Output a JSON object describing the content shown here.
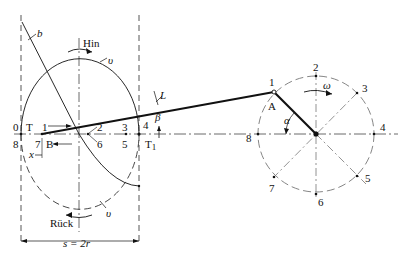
{
  "diagram": {
    "colors": {
      "line": "#111111",
      "dashed": "#555555",
      "bg": "#ffffff"
    },
    "labels": {
      "b": "b",
      "hin": "Hin",
      "v_top": "υ",
      "v_bottom": "υ",
      "rueck": "Rück",
      "L": "L",
      "A": "A",
      "alpha": "α",
      "beta": "β",
      "omega": "ω",
      "x": "x",
      "T": "T",
      "T1": "T",
      "T1_sub": "1",
      "B": "B",
      "stroke": "s = 2r"
    },
    "left_points": {
      "p0": "0",
      "p8": "8",
      "p1": "1",
      "p7": "7",
      "p2": "2",
      "p6": "6",
      "p3": "3",
      "p5": "5",
      "p4": "4"
    },
    "crank_points": {
      "p1": "1",
      "p2": "2",
      "p3": "3",
      "p4": "4",
      "p5": "5",
      "p6": "6",
      "p7": "7",
      "p8": "8"
    }
  }
}
